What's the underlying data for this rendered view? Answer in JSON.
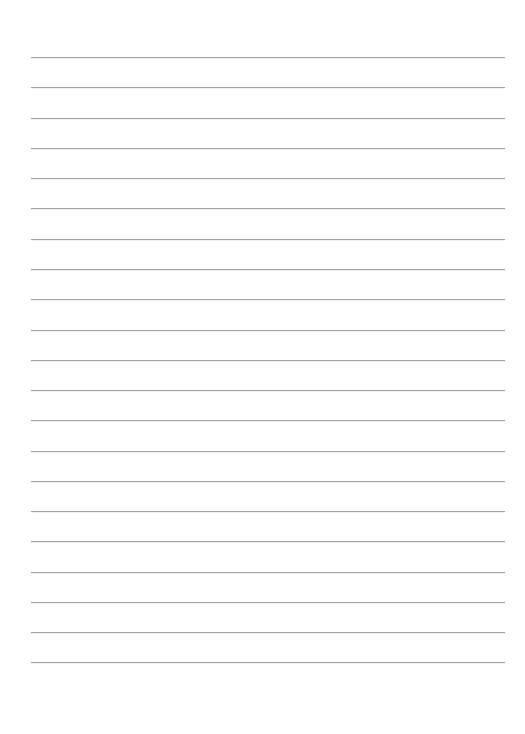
{
  "document": {
    "kind": "lined-paper-template",
    "title": "",
    "page_width": 525,
    "page_height": 734,
    "background_color": "#ffffff"
  },
  "header": {
    "title": "",
    "top": 0,
    "height": 50
  },
  "footer": {
    "text": "",
    "top": 668,
    "height": 66
  },
  "ruling": {
    "line_color": "#a3a3a3",
    "line_thickness": 1,
    "left_margin": 31,
    "right_margin": 20,
    "line_start_x": 31,
    "line_end_x": 505,
    "line_length": 474,
    "first_line_y": 57,
    "last_line_y": 662,
    "line_spacing": 30.25,
    "line_count": 21,
    "line_positions": [
      57,
      87,
      118,
      148,
      178,
      208,
      239,
      269,
      299,
      330,
      360,
      390,
      420,
      451,
      481,
      511,
      541,
      572,
      602,
      632,
      662
    ]
  }
}
